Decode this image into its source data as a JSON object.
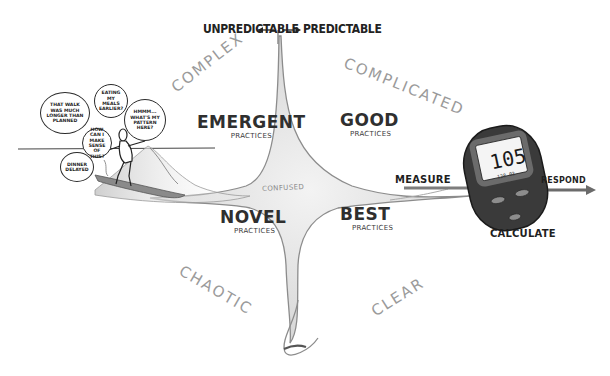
{
  "axis": {
    "left": "UNPREDICTABLE",
    "right": "PREDICTABLE"
  },
  "domains": {
    "complex": "COMPLEX",
    "complicated": "COMPLICATED",
    "chaotic": "CHAOTIC",
    "clear": "CLEAR",
    "confused": "CONFUSED"
  },
  "practices": {
    "emergent": {
      "title": "EMERGENT",
      "sub": "PRACTICES"
    },
    "good": {
      "title": "GOOD",
      "sub": "PRACTICES"
    },
    "novel": {
      "title": "NOVEL",
      "sub": "PRACTICES"
    },
    "best": {
      "title": "BEST",
      "sub": "PRACTICES"
    }
  },
  "thought_bubbles": [
    "THAT WALK WAS MUCH LONGER THAN PLANNED",
    "EATING MY MEALS EARLIER?",
    "HOW CAN I MAKE SENSE OF THIS?",
    "HMMM... WHAT'S MY PATTERN HERE?",
    "DINNER DELAYED"
  ],
  "flow": {
    "measure": "MEASURE",
    "calculate": "CALCULATE",
    "respond": "RESPOND"
  },
  "glucose_meter": {
    "reading": "105",
    "sub_reading": "128 03"
  },
  "colors": {
    "ink": "#222222",
    "pencil_gray": "#9a9a9a",
    "meter_body": "#3a3a3a",
    "meter_rim": "#6b6b6b",
    "arrow_gray": "#7d7d7d"
  }
}
